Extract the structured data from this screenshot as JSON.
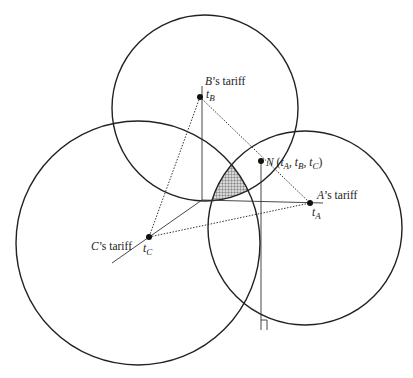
{
  "diagram": {
    "title": "",
    "labels": {
      "b_tariff": "B’s tariff",
      "a_tariff": "A’s tariff",
      "c_tariff": "C’s tariff",
      "t_b": "t",
      "t_b_sub": "B",
      "t_a": "t",
      "t_a_sub": "A",
      "t_c": "t",
      "t_c_sub": "C",
      "n_point": "N (t",
      "n_a": "A",
      "n_sep1": ", t",
      "n_b": "B",
      "n_sep2": ", t",
      "n_c": "C",
      "n_close": ")"
    },
    "colors": {
      "stroke": "#222222",
      "shade": "#9a9a9a"
    },
    "circles": [
      {
        "name": "circle-b",
        "cx": 205,
        "cy": 108,
        "r": 93
      },
      {
        "name": "circle-a",
        "cx": 305,
        "cy": 228,
        "r": 97
      },
      {
        "name": "circle-c",
        "cx": 138,
        "cy": 243,
        "r": 122
      }
    ],
    "points": [
      {
        "name": "t_B",
        "x": 200,
        "y": 97
      },
      {
        "name": "N",
        "x": 261,
        "y": 161
      },
      {
        "name": "t_A",
        "x": 310,
        "y": 203
      },
      {
        "name": "t_C",
        "x": 149,
        "y": 237
      }
    ]
  }
}
